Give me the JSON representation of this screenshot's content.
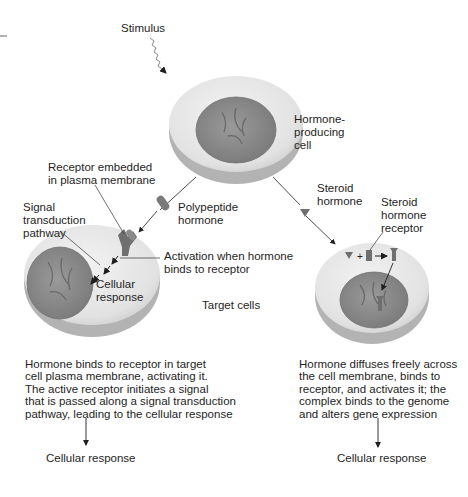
{
  "diagram": {
    "title": "",
    "stimulus_label": "Stimulus",
    "producing_cell_label": "Hormone-\nproducing\ncell",
    "receptor_embedded_label": "Receptor embedded\nin plasma membrane",
    "polypeptide_label": "Polypeptide\nhormone",
    "signal_pathway_label": "Signal\ntransduction\npathway",
    "activation_label": "Activation when hormone\nbinds to receptor",
    "cellular_response_inner": "Cellular\nresponse",
    "target_cells_label": "Target cells",
    "steroid_hormone_label": "Steroid\nhormone",
    "steroid_receptor_label": "Steroid\nhormone\nreceptor",
    "left_description": "Hormone binds to receptor in target\ncell plasma membrane, activating it.\nThe active receptor initiates a signal\nthat is passed along a signal transduction\npathway, leading to the cellular response",
    "right_description": "Hormone diffuses freely across\nthe cell membrane, binds to\nreceptor, and activates it; the\ncomplex binds to the genome\nand alters gene expression",
    "left_outcome": "Cellular response",
    "right_outcome": "Cellular response",
    "colors": {
      "cell_outer": "#e4e4e4",
      "cell_rim": "#a9a9a9",
      "nucleus": "#8a8a8a",
      "receptor": "#6f6f6f",
      "arrow": "#1e1e1e"
    }
  }
}
